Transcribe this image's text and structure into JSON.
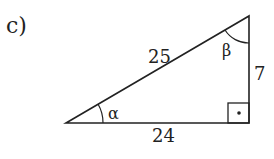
{
  "part_label": "c)",
  "triangle": {
    "hypotenuse": "25",
    "adjacent": "24",
    "opposite": "7",
    "angle_alpha": "α",
    "angle_beta": "β",
    "right_angle_marker": "·"
  },
  "colors": {
    "stroke": "#222222",
    "background": "#ffffff"
  }
}
